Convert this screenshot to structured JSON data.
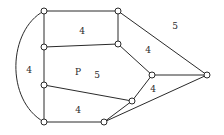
{
  "diagram": {
    "type": "planar-graph",
    "nodes": [
      {
        "id": "A",
        "x": 44,
        "y": 11
      },
      {
        "id": "B",
        "x": 118,
        "y": 11
      },
      {
        "id": "C",
        "x": 44,
        "y": 47
      },
      {
        "id": "D",
        "x": 118,
        "y": 44
      },
      {
        "id": "E",
        "x": 44,
        "y": 85
      },
      {
        "id": "F",
        "x": 44,
        "y": 122
      },
      {
        "id": "G",
        "x": 152,
        "y": 75
      },
      {
        "id": "H",
        "x": 207,
        "y": 75
      },
      {
        "id": "I",
        "x": 132,
        "y": 101
      },
      {
        "id": "J",
        "x": 104,
        "y": 122
      }
    ],
    "edges": [
      [
        "A",
        "B"
      ],
      [
        "A",
        "C"
      ],
      [
        "C",
        "D"
      ],
      [
        "B",
        "D"
      ],
      [
        "C",
        "E"
      ],
      [
        "E",
        "F"
      ],
      [
        "B",
        "H"
      ],
      [
        "D",
        "G"
      ],
      [
        "G",
        "H"
      ],
      [
        "G",
        "I"
      ],
      [
        "E",
        "I"
      ],
      [
        "I",
        "J"
      ],
      [
        "F",
        "J"
      ],
      [
        "J",
        "H"
      ]
    ],
    "arc": {
      "from": "A",
      "to": "F",
      "label": "outer-left-arc"
    },
    "face_labels": [
      {
        "text": "4",
        "x": 82,
        "y": 31,
        "face": "top"
      },
      {
        "text": "5",
        "x": 175,
        "y": 26,
        "face": "outer"
      },
      {
        "text": "4",
        "x": 148,
        "y": 50,
        "face": "right-upper"
      },
      {
        "text": "4",
        "x": 29,
        "y": 70,
        "face": "left-arc"
      },
      {
        "text": "P",
        "x": 78,
        "y": 72,
        "face": "center-name"
      },
      {
        "text": "5",
        "x": 97,
        "y": 75,
        "face": "center"
      },
      {
        "text": "4",
        "x": 153,
        "y": 89,
        "face": "right-lower"
      },
      {
        "text": "4",
        "x": 78,
        "y": 110,
        "face": "bottom"
      }
    ]
  }
}
